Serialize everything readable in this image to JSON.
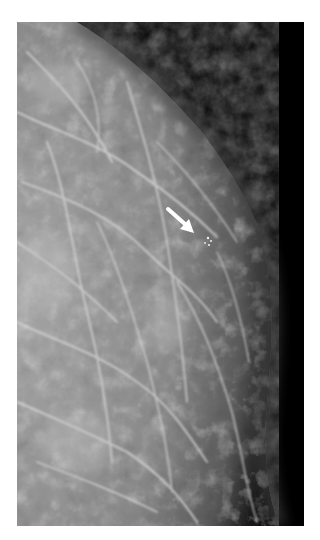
{
  "figure": {
    "annotation": {
      "type": "arrow",
      "color": "#ffffff",
      "direction": "down-right",
      "target": "microcalcification cluster"
    },
    "colors": {
      "background": "#ffffff",
      "tissue_light": "#b8b8b8",
      "tissue_mid": "#7a7a7a",
      "exterior": "#000000"
    }
  }
}
